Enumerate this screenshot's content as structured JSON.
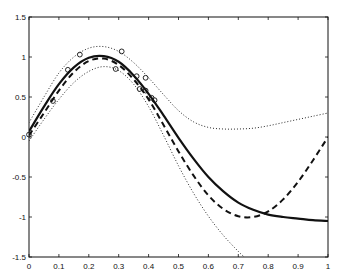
{
  "chart_data": {
    "type": "line",
    "title": "",
    "xlabel": "",
    "ylabel": "",
    "xlim": [
      0,
      1
    ],
    "ylim": [
      -1.5,
      1.5
    ],
    "grid": false,
    "legend": null,
    "x_ticks": [
      "0",
      "0.1",
      "0.2",
      "0.3",
      "0.4",
      "0.5",
      "0.6",
      "0.7",
      "0.8",
      "0.9",
      "1"
    ],
    "y_ticks": [
      "-1.5",
      "-1",
      "-0.5",
      "0",
      "0.5",
      "1",
      "1.5"
    ],
    "series": [
      {
        "name": "fit",
        "style": "solid",
        "color": "#111111",
        "x": [
          0,
          0.05,
          0.1,
          0.15,
          0.2,
          0.25,
          0.3,
          0.35,
          0.4,
          0.45,
          0.5,
          0.55,
          0.6,
          0.65,
          0.7,
          0.75,
          0.8,
          0.85,
          0.9,
          0.95,
          1
        ],
        "y": [
          0.07,
          0.38,
          0.66,
          0.87,
          0.99,
          1.01,
          0.94,
          0.77,
          0.54,
          0.27,
          -0.01,
          -0.27,
          -0.5,
          -0.68,
          -0.82,
          -0.91,
          -0.97,
          -1.0,
          -1.02,
          -1.04,
          -1.05
        ]
      },
      {
        "name": "dashed",
        "style": "dashed",
        "color": "#111111",
        "x": [
          0,
          0.05,
          0.1,
          0.15,
          0.2,
          0.25,
          0.3,
          0.35,
          0.4,
          0.45,
          0.5,
          0.55,
          0.6,
          0.65,
          0.7,
          0.75,
          0.8,
          0.85,
          0.9,
          0.95,
          1
        ],
        "y": [
          0.02,
          0.3,
          0.58,
          0.81,
          0.95,
          0.98,
          0.9,
          0.72,
          0.47,
          0.15,
          -0.18,
          -0.48,
          -0.73,
          -0.9,
          -0.99,
          -1.0,
          -0.93,
          -0.78,
          -0.56,
          -0.29,
          0.0
        ]
      },
      {
        "name": "upper-bound",
        "style": "dotted",
        "color": "#111111",
        "x": [
          0,
          0.05,
          0.1,
          0.15,
          0.2,
          0.25,
          0.3,
          0.35,
          0.4,
          0.45,
          0.5,
          0.55,
          0.6,
          0.65,
          0.7,
          0.75,
          0.8,
          0.85,
          0.9,
          0.95,
          1
        ],
        "y": [
          0.18,
          0.5,
          0.8,
          1.0,
          1.11,
          1.13,
          1.07,
          0.93,
          0.74,
          0.53,
          0.33,
          0.19,
          0.12,
          0.1,
          0.1,
          0.11,
          0.14,
          0.18,
          0.22,
          0.26,
          0.3
        ]
      },
      {
        "name": "lower-bound",
        "style": "dotted",
        "color": "#111111",
        "x": [
          0,
          0.05,
          0.1,
          0.15,
          0.2,
          0.25,
          0.3,
          0.35,
          0.4,
          0.45,
          0.5,
          0.55,
          0.6,
          0.65,
          0.7,
          0.72
        ],
        "y": [
          -0.05,
          0.22,
          0.47,
          0.68,
          0.82,
          0.88,
          0.83,
          0.66,
          0.38,
          0.02,
          -0.36,
          -0.7,
          -0.99,
          -1.23,
          -1.43,
          -1.5
        ]
      },
      {
        "name": "observations",
        "style": "markers",
        "marker": "circle-open",
        "color": "#111111",
        "x": [
          0.0,
          0.08,
          0.13,
          0.17,
          0.29,
          0.31,
          0.36,
          0.39,
          0.37,
          0.39,
          0.41,
          0.42
        ],
        "y": [
          0.03,
          0.45,
          0.84,
          1.03,
          0.85,
          1.07,
          0.76,
          0.74,
          0.6,
          0.58,
          0.49,
          0.46
        ]
      }
    ]
  }
}
